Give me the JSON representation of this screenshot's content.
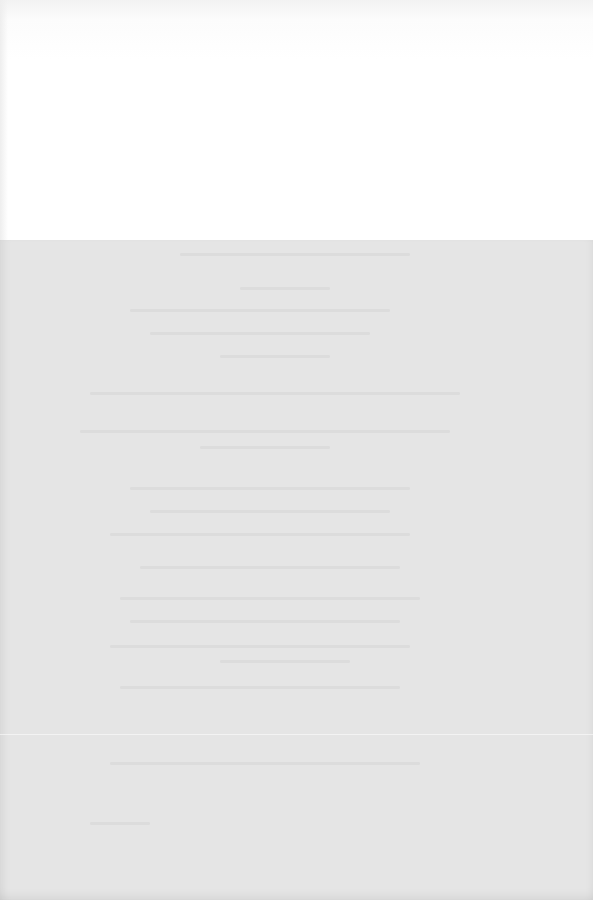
{
  "page": {
    "type": "blank scanned page with faint bleed-through",
    "top_band_color": "#ffffff",
    "scan_area_color": "#e5e5e5",
    "visible_text": []
  },
  "ghost_lines": [
    {
      "top": 253,
      "left": 180,
      "width": 230
    },
    {
      "top": 287,
      "left": 240,
      "width": 90
    },
    {
      "top": 309,
      "left": 130,
      "width": 260
    },
    {
      "top": 332,
      "left": 150,
      "width": 220
    },
    {
      "top": 355,
      "left": 220,
      "width": 110
    },
    {
      "top": 392,
      "left": 90,
      "width": 370
    },
    {
      "top": 430,
      "left": 80,
      "width": 370
    },
    {
      "top": 446,
      "left": 200,
      "width": 130
    },
    {
      "top": 487,
      "left": 130,
      "width": 280
    },
    {
      "top": 510,
      "left": 150,
      "width": 240
    },
    {
      "top": 533,
      "left": 110,
      "width": 300
    },
    {
      "top": 566,
      "left": 140,
      "width": 260
    },
    {
      "top": 597,
      "left": 120,
      "width": 300
    },
    {
      "top": 620,
      "left": 130,
      "width": 270
    },
    {
      "top": 645,
      "left": 110,
      "width": 300
    },
    {
      "top": 660,
      "left": 220,
      "width": 130
    },
    {
      "top": 686,
      "left": 120,
      "width": 280
    },
    {
      "top": 762,
      "left": 110,
      "width": 310
    },
    {
      "top": 822,
      "left": 90,
      "width": 60
    }
  ]
}
